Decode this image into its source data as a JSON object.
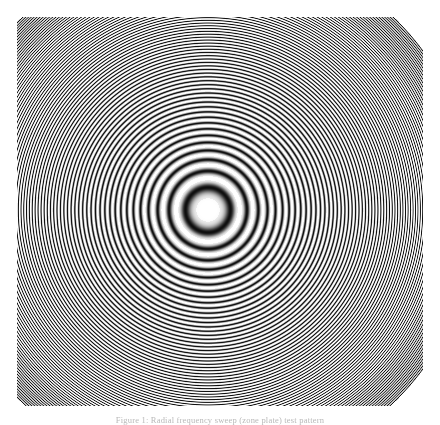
{
  "figure": {
    "name": "radial-zone-plate",
    "kind": "fresnel-zone-plate",
    "background_color": "#ffffff",
    "ink_color": "#000000",
    "caption": "Figure 1: Radial frequency sweep (zone plate) test pattern",
    "caption_color": "#b9b9b9"
  },
  "chart_data": {
    "type": "heatmap",
    "title": "",
    "subtitle": "",
    "xlabel": "",
    "ylabel": "",
    "function": "intensity = 0.5 + 0.5 * cos(k * r^2)",
    "center": {
      "x": 208,
      "y": 210
    },
    "center_dot": {
      "radius": 6,
      "color": "#ffffff"
    },
    "pattern_bounds": {
      "x": 17,
      "y": 17,
      "width": 406,
      "height": 389
    },
    "chirp_coefficient": 0.0062,
    "ring_count": 64,
    "outer_ring_spacing_px": 5,
    "black_core_radius_px": 40,
    "grid": false,
    "legend": null,
    "xlim": [
      0,
      440
    ],
    "ylim": [
      0,
      425
    ],
    "ring_radii": [
      9,
      13,
      17,
      20,
      22,
      25,
      27,
      29,
      31,
      33,
      35,
      37,
      39,
      41,
      43,
      45,
      47,
      49,
      51,
      53,
      56,
      59,
      62,
      65,
      68,
      71,
      74,
      77,
      80,
      84,
      88,
      92,
      96,
      100,
      104,
      108,
      112,
      116,
      120,
      125,
      130,
      135,
      140,
      145,
      150,
      155,
      160,
      165,
      170,
      176,
      182,
      188,
      194,
      200,
      206,
      212,
      218,
      224,
      230,
      236,
      243,
      250,
      257,
      264
    ]
  }
}
